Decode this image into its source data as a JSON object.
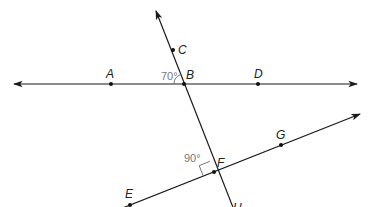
{
  "diagram": {
    "type": "geometry-lines",
    "colors": {
      "line": "#1a1a1a",
      "angle_label": "#777777",
      "point": "#111111"
    },
    "points": [
      {
        "id": "A",
        "label": "A",
        "x": 111,
        "y": 84
      },
      {
        "id": "B",
        "label": "B",
        "x": 184,
        "y": 84
      },
      {
        "id": "C",
        "label": "C",
        "x": 173,
        "y": 50
      },
      {
        "id": "D",
        "label": "D",
        "x": 258,
        "y": 84
      },
      {
        "id": "E",
        "label": "E",
        "x": 130,
        "y": 205
      },
      {
        "id": "F",
        "label": "F",
        "x": 214,
        "y": 172
      },
      {
        "id": "G",
        "label": "G",
        "x": 281,
        "y": 145
      },
      {
        "id": "H",
        "label": "H",
        "x": 232,
        "y": 207
      }
    ],
    "lines": [
      {
        "name": "line AD",
        "through": [
          "A",
          "B",
          "D"
        ],
        "arrows": "both"
      },
      {
        "name": "line CH",
        "through": [
          "C",
          "B",
          "F",
          "H"
        ],
        "arrows": "top"
      },
      {
        "name": "line EG",
        "through": [
          "E",
          "F",
          "G"
        ],
        "arrows": "right"
      }
    ],
    "angles": [
      {
        "vertex": "B",
        "label": "70°",
        "type": "arc"
      },
      {
        "vertex": "F",
        "label": "90°",
        "type": "right-angle"
      }
    ]
  }
}
